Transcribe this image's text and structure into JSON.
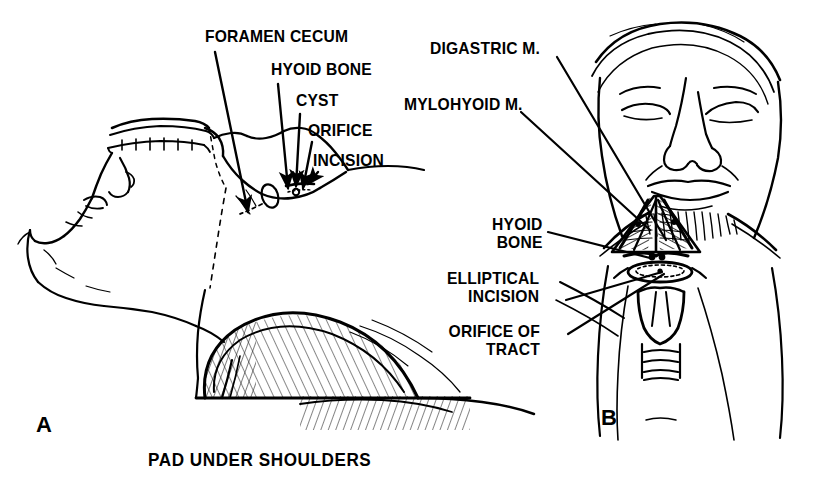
{
  "figure": {
    "background_color": "#ffffff",
    "ink_color": "#000000",
    "width": 816,
    "height": 489
  },
  "panels": [
    {
      "id": "A",
      "letter": "A",
      "letter_pos": {
        "x": 36,
        "y": 412
      },
      "view": "lateral view of patient supine with neck hyperextended",
      "caption": "PAD UNDER SHOULDERS",
      "caption_pos": {
        "x": 148,
        "y": 450
      },
      "labels": [
        {
          "text": "FORAMEN CECUM",
          "name": "label-foramen-cecum",
          "x": 205,
          "y": 28,
          "align": "left",
          "leader": {
            "x1": 215,
            "y1": 52,
            "x2": 248,
            "y2": 212
          }
        },
        {
          "text": "HYOID BONE",
          "name": "label-hyoid-bone",
          "x": 271,
          "y": 61,
          "align": "left",
          "leader": {
            "x1": 278,
            "y1": 84,
            "x2": 288,
            "y2": 188
          }
        },
        {
          "text": "CYST",
          "name": "label-cyst",
          "x": 296,
          "y": 92,
          "align": "left",
          "leader": {
            "x1": 300,
            "y1": 114,
            "x2": 296,
            "y2": 192
          }
        },
        {
          "text": "ORIFICE",
          "name": "label-orifice",
          "x": 308,
          "y": 122,
          "align": "left",
          "leader": {
            "x1": 312,
            "y1": 142,
            "x2": 302,
            "y2": 192
          }
        },
        {
          "text": "INCISION",
          "name": "label-incision",
          "x": 313,
          "y": 152,
          "align": "left",
          "leader": {
            "x1": 318,
            "y1": 172,
            "x2": 310,
            "y2": 186
          }
        }
      ]
    },
    {
      "id": "B",
      "letter": "B",
      "letter_pos": {
        "x": 601,
        "y": 405
      },
      "view": "anterior view of operative field in submental region",
      "labels": [
        {
          "text": "DIGASTRIC M.",
          "name": "label-digastric-m",
          "x": 430,
          "y": 40,
          "align": "left",
          "leader": {
            "x1": 557,
            "y1": 57,
            "x2": 665,
            "y2": 240
          }
        },
        {
          "text": "MYLOHYOID M.",
          "name": "label-mylohyoid-m",
          "x": 404,
          "y": 96,
          "align": "left",
          "leader": {
            "x1": 521,
            "y1": 112,
            "x2": 648,
            "y2": 228
          }
        },
        {
          "text": "HYOID\nBONE",
          "name": "label-hyoid-bone-b",
          "x": 480,
          "y": 216,
          "align": "left",
          "leader": {
            "x1": 548,
            "y1": 232,
            "x2": 650,
            "y2": 258
          }
        },
        {
          "text": "ELLIPTICAL\nINCISION",
          "name": "label-elliptical-incision",
          "x": 437,
          "y": 270,
          "align": "left",
          "leader": {
            "x1": 566,
            "y1": 300,
            "x2": 660,
            "y2": 272
          }
        },
        {
          "text": "ORIFICE OF\nTRACT",
          "name": "label-orifice-of-tract",
          "x": 447,
          "y": 323,
          "align": "left",
          "leader": {
            "x1": 568,
            "y1": 334,
            "x2": 662,
            "y2": 270
          }
        }
      ]
    }
  ],
  "anatomy": {
    "panel_a": [
      "head in profile, inverted/extended",
      "upper teeth and lip",
      "nose",
      "closed eye",
      "ear",
      "neck with cyst and elliptical incision marking",
      "shoulder raised over pad",
      "chest and arm"
    ],
    "panel_b": [
      "forehead drape",
      "eyes closed",
      "nose",
      "lips and chin",
      "mylohyoid muscle (hatched triangle)",
      "digastric muscles (anterior bellies)",
      "hyoid bone",
      "elliptical incision with dotted outline",
      "thyroid cartilage",
      "tracheal rings",
      "retractors"
    ]
  }
}
